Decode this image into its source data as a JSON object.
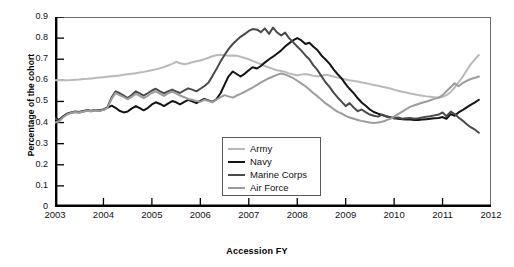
{
  "chart_data": {
    "type": "line",
    "title": "",
    "xlabel": "Accession FY",
    "ylabel": "Percentage of the cohort",
    "xlim": [
      2003,
      2012
    ],
    "ylim": [
      0,
      0.9
    ],
    "xticks": [
      "2003",
      "2004",
      "2005",
      "2006",
      "2007",
      "2008",
      "2009",
      "2010",
      "2011",
      "2012"
    ],
    "yticks": [
      "0",
      "0.1",
      "0.2",
      "0.3",
      "0.4",
      "0.5",
      "0.6",
      "0.7",
      "0.8",
      "0.9"
    ],
    "grid": false,
    "legend_position": "lower-center",
    "series": [
      {
        "name": "Army",
        "color": "#b9b9b9",
        "x": [
          2003.0,
          2003.08,
          2003.17,
          2003.25,
          2003.33,
          2003.42,
          2003.5,
          2003.58,
          2003.67,
          2003.75,
          2003.83,
          2003.92,
          2004.0,
          2004.08,
          2004.17,
          2004.25,
          2004.33,
          2004.42,
          2004.5,
          2004.58,
          2004.67,
          2004.75,
          2004.83,
          2004.92,
          2005.0,
          2005.08,
          2005.17,
          2005.25,
          2005.33,
          2005.42,
          2005.5,
          2005.58,
          2005.67,
          2005.75,
          2005.83,
          2005.92,
          2006.0,
          2006.08,
          2006.17,
          2006.25,
          2006.33,
          2006.42,
          2006.5,
          2006.58,
          2006.67,
          2006.75,
          2006.83,
          2006.92,
          2007.0,
          2007.08,
          2007.17,
          2007.25,
          2007.33,
          2007.42,
          2007.5,
          2007.58,
          2007.67,
          2007.75,
          2007.83,
          2007.92,
          2008.0,
          2008.08,
          2008.17,
          2008.25,
          2008.33,
          2008.42,
          2008.5,
          2008.58,
          2008.67,
          2008.75,
          2008.83,
          2008.92,
          2009.0,
          2009.08,
          2009.17,
          2009.25,
          2009.33,
          2009.42,
          2009.5,
          2009.58,
          2009.67,
          2009.75,
          2009.83,
          2009.92,
          2010.0,
          2010.08,
          2010.17,
          2010.25,
          2010.33,
          2010.42,
          2010.5,
          2010.58,
          2010.67,
          2010.75,
          2010.83,
          2010.92,
          2011.0,
          2011.08,
          2011.17,
          2011.25,
          2011.33,
          2011.42,
          2011.5,
          2011.58,
          2011.67,
          2011.75
        ],
        "values": [
          0.6,
          0.601,
          0.6,
          0.6,
          0.601,
          0.603,
          0.604,
          0.606,
          0.607,
          0.609,
          0.611,
          0.613,
          0.615,
          0.617,
          0.619,
          0.621,
          0.623,
          0.626,
          0.629,
          0.631,
          0.634,
          0.637,
          0.64,
          0.644,
          0.648,
          0.652,
          0.657,
          0.663,
          0.67,
          0.678,
          0.688,
          0.681,
          0.676,
          0.68,
          0.686,
          0.69,
          0.694,
          0.7,
          0.707,
          0.714,
          0.719,
          0.721,
          0.719,
          0.716,
          0.718,
          0.717,
          0.712,
          0.706,
          0.7,
          0.692,
          0.684,
          0.676,
          0.668,
          0.661,
          0.654,
          0.648,
          0.644,
          0.64,
          0.633,
          0.628,
          0.624,
          0.627,
          0.63,
          0.626,
          0.622,
          0.619,
          0.622,
          0.626,
          0.623,
          0.618,
          0.613,
          0.608,
          0.604,
          0.6,
          0.597,
          0.594,
          0.59,
          0.586,
          0.582,
          0.578,
          0.574,
          0.57,
          0.566,
          0.561,
          0.556,
          0.551,
          0.546,
          0.542,
          0.538,
          0.534,
          0.53,
          0.527,
          0.524,
          0.522,
          0.52,
          0.519,
          0.522,
          0.53,
          0.545,
          0.566,
          0.59,
          0.618,
          0.648,
          0.676,
          0.7,
          0.72
        ]
      },
      {
        "name": "Navy",
        "color": "#141414",
        "x": [
          2003.0,
          2003.08,
          2003.17,
          2003.25,
          2003.33,
          2003.42,
          2003.5,
          2003.58,
          2003.67,
          2003.75,
          2003.83,
          2003.92,
          2004.0,
          2004.08,
          2004.17,
          2004.25,
          2004.33,
          2004.42,
          2004.5,
          2004.58,
          2004.67,
          2004.75,
          2004.83,
          2004.92,
          2005.0,
          2005.08,
          2005.17,
          2005.25,
          2005.33,
          2005.42,
          2005.5,
          2005.58,
          2005.67,
          2005.75,
          2005.83,
          2005.92,
          2006.0,
          2006.08,
          2006.17,
          2006.25,
          2006.33,
          2006.42,
          2006.5,
          2006.58,
          2006.67,
          2006.75,
          2006.83,
          2006.92,
          2007.0,
          2007.08,
          2007.17,
          2007.25,
          2007.33,
          2007.42,
          2007.5,
          2007.58,
          2007.67,
          2007.75,
          2007.83,
          2007.92,
          2008.0,
          2008.08,
          2008.17,
          2008.25,
          2008.33,
          2008.42,
          2008.5,
          2008.58,
          2008.67,
          2008.75,
          2008.83,
          2008.92,
          2009.0,
          2009.08,
          2009.17,
          2009.25,
          2009.33,
          2009.42,
          2009.5,
          2009.58,
          2009.67,
          2009.75,
          2009.83,
          2009.92,
          2010.0,
          2010.08,
          2010.17,
          2010.25,
          2010.33,
          2010.42,
          2010.5,
          2010.58,
          2010.67,
          2010.75,
          2010.83,
          2010.92,
          2011.0,
          2011.08,
          2011.17,
          2011.25,
          2011.33,
          2011.42,
          2011.5,
          2011.58,
          2011.67,
          2011.75
        ],
        "values": [
          0.425,
          0.412,
          0.43,
          0.442,
          0.448,
          0.452,
          0.45,
          0.455,
          0.458,
          0.456,
          0.46,
          0.458,
          0.462,
          0.47,
          0.48,
          0.47,
          0.456,
          0.448,
          0.452,
          0.466,
          0.478,
          0.468,
          0.458,
          0.47,
          0.486,
          0.496,
          0.488,
          0.478,
          0.49,
          0.502,
          0.496,
          0.486,
          0.498,
          0.508,
          0.5,
          0.492,
          0.503,
          0.512,
          0.505,
          0.498,
          0.51,
          0.54,
          0.58,
          0.618,
          0.642,
          0.63,
          0.618,
          0.632,
          0.648,
          0.662,
          0.656,
          0.668,
          0.684,
          0.7,
          0.712,
          0.726,
          0.742,
          0.76,
          0.775,
          0.79,
          0.8,
          0.79,
          0.772,
          0.778,
          0.76,
          0.742,
          0.718,
          0.7,
          0.678,
          0.652,
          0.63,
          0.608,
          0.582,
          0.56,
          0.538,
          0.515,
          0.495,
          0.478,
          0.462,
          0.45,
          0.442,
          0.436,
          0.43,
          0.425,
          0.42,
          0.418,
          0.416,
          0.415,
          0.414,
          0.412,
          0.412,
          0.414,
          0.416,
          0.418,
          0.42,
          0.422,
          0.426,
          0.418,
          0.44,
          0.432,
          0.448,
          0.46,
          0.472,
          0.484,
          0.496,
          0.508
        ]
      },
      {
        "name": "Marine Corps",
        "color": "#4a4a4a",
        "x": [
          2003.0,
          2003.08,
          2003.17,
          2003.25,
          2003.33,
          2003.42,
          2003.5,
          2003.58,
          2003.67,
          2003.75,
          2003.83,
          2003.92,
          2004.0,
          2004.08,
          2004.17,
          2004.25,
          2004.33,
          2004.42,
          2004.5,
          2004.58,
          2004.67,
          2004.75,
          2004.83,
          2004.92,
          2005.0,
          2005.08,
          2005.17,
          2005.25,
          2005.33,
          2005.42,
          2005.5,
          2005.58,
          2005.67,
          2005.75,
          2005.83,
          2005.92,
          2006.0,
          2006.08,
          2006.17,
          2006.25,
          2006.33,
          2006.42,
          2006.5,
          2006.58,
          2006.67,
          2006.75,
          2006.83,
          2006.92,
          2007.0,
          2007.08,
          2007.17,
          2007.25,
          2007.33,
          2007.42,
          2007.5,
          2007.58,
          2007.67,
          2007.75,
          2007.83,
          2007.92,
          2008.0,
          2008.08,
          2008.17,
          2008.25,
          2008.33,
          2008.42,
          2008.5,
          2008.58,
          2008.67,
          2008.75,
          2008.83,
          2008.92,
          2009.0,
          2009.08,
          2009.17,
          2009.25,
          2009.33,
          2009.42,
          2009.5,
          2009.58,
          2009.67,
          2009.75,
          2009.83,
          2009.92,
          2010.0,
          2010.08,
          2010.17,
          2010.25,
          2010.33,
          2010.42,
          2010.5,
          2010.58,
          2010.67,
          2010.75,
          2010.83,
          2010.92,
          2011.0,
          2011.08,
          2011.17,
          2011.25,
          2011.33,
          2011.42,
          2011.5,
          2011.58,
          2011.67,
          2011.75
        ],
        "values": [
          0.42,
          0.408,
          0.428,
          0.44,
          0.446,
          0.45,
          0.448,
          0.452,
          0.456,
          0.454,
          0.458,
          0.456,
          0.46,
          0.472,
          0.52,
          0.548,
          0.54,
          0.528,
          0.516,
          0.53,
          0.548,
          0.538,
          0.528,
          0.54,
          0.552,
          0.56,
          0.548,
          0.538,
          0.548,
          0.556,
          0.548,
          0.54,
          0.552,
          0.562,
          0.556,
          0.548,
          0.56,
          0.572,
          0.59,
          0.62,
          0.652,
          0.69,
          0.72,
          0.748,
          0.772,
          0.79,
          0.806,
          0.82,
          0.834,
          0.843,
          0.84,
          0.828,
          0.846,
          0.82,
          0.85,
          0.828,
          0.812,
          0.826,
          0.8,
          0.78,
          0.76,
          0.742,
          0.718,
          0.7,
          0.672,
          0.648,
          0.62,
          0.592,
          0.568,
          0.542,
          0.52,
          0.498,
          0.478,
          0.492,
          0.47,
          0.454,
          0.462,
          0.448,
          0.438,
          0.432,
          0.428,
          0.438,
          0.43,
          0.424,
          0.42,
          0.424,
          0.418,
          0.42,
          0.422,
          0.418,
          0.42,
          0.424,
          0.428,
          0.43,
          0.434,
          0.438,
          0.448,
          0.43,
          0.452,
          0.44,
          0.424,
          0.408,
          0.392,
          0.378,
          0.366,
          0.352
        ]
      },
      {
        "name": "Air Force",
        "color": "#9c9c9c",
        "x": [
          2003.0,
          2003.08,
          2003.17,
          2003.25,
          2003.33,
          2003.42,
          2003.5,
          2003.58,
          2003.67,
          2003.75,
          2003.83,
          2003.92,
          2004.0,
          2004.08,
          2004.17,
          2004.25,
          2004.33,
          2004.42,
          2004.5,
          2004.58,
          2004.67,
          2004.75,
          2004.83,
          2004.92,
          2005.0,
          2005.08,
          2005.17,
          2005.25,
          2005.33,
          2005.42,
          2005.5,
          2005.58,
          2005.67,
          2005.75,
          2005.83,
          2005.92,
          2006.0,
          2006.08,
          2006.17,
          2006.25,
          2006.33,
          2006.42,
          2006.5,
          2006.58,
          2006.67,
          2006.75,
          2006.83,
          2006.92,
          2007.0,
          2007.08,
          2007.17,
          2007.25,
          2007.33,
          2007.42,
          2007.5,
          2007.58,
          2007.67,
          2007.75,
          2007.83,
          2007.92,
          2008.0,
          2008.08,
          2008.17,
          2008.25,
          2008.33,
          2008.42,
          2008.5,
          2008.58,
          2008.67,
          2008.75,
          2008.83,
          2008.92,
          2009.0,
          2009.08,
          2009.17,
          2009.25,
          2009.33,
          2009.42,
          2009.5,
          2009.58,
          2009.67,
          2009.75,
          2009.83,
          2009.92,
          2010.0,
          2010.08,
          2010.17,
          2010.25,
          2010.33,
          2010.42,
          2010.5,
          2010.58,
          2010.67,
          2010.75,
          2010.83,
          2010.92,
          2011.0,
          2011.08,
          2011.17,
          2011.25,
          2011.33,
          2011.42,
          2011.5,
          2011.58,
          2011.67,
          2011.75
        ],
        "values": [
          0.4,
          0.405,
          0.425,
          0.438,
          0.446,
          0.45,
          0.448,
          0.452,
          0.456,
          0.454,
          0.458,
          0.456,
          0.46,
          0.468,
          0.512,
          0.54,
          0.53,
          0.52,
          0.51,
          0.522,
          0.536,
          0.526,
          0.516,
          0.528,
          0.54,
          0.548,
          0.536,
          0.526,
          0.538,
          0.546,
          0.538,
          0.528,
          0.52,
          0.512,
          0.508,
          0.502,
          0.498,
          0.508,
          0.502,
          0.496,
          0.508,
          0.52,
          0.53,
          0.524,
          0.518,
          0.528,
          0.536,
          0.546,
          0.556,
          0.566,
          0.578,
          0.59,
          0.6,
          0.61,
          0.618,
          0.626,
          0.632,
          0.628,
          0.62,
          0.61,
          0.598,
          0.586,
          0.572,
          0.556,
          0.54,
          0.524,
          0.508,
          0.492,
          0.478,
          0.464,
          0.452,
          0.442,
          0.432,
          0.424,
          0.418,
          0.412,
          0.408,
          0.404,
          0.4,
          0.398,
          0.4,
          0.404,
          0.41,
          0.418,
          0.428,
          0.44,
          0.452,
          0.464,
          0.474,
          0.482,
          0.488,
          0.494,
          0.5,
          0.506,
          0.512,
          0.518,
          0.53,
          0.548,
          0.568,
          0.586,
          0.572,
          0.588,
          0.598,
          0.606,
          0.612,
          0.618
        ]
      }
    ]
  },
  "legend": {
    "items": [
      {
        "label": "Army"
      },
      {
        "label": "Navy"
      },
      {
        "label": "Marine Corps"
      },
      {
        "label": "Air Force"
      }
    ]
  }
}
